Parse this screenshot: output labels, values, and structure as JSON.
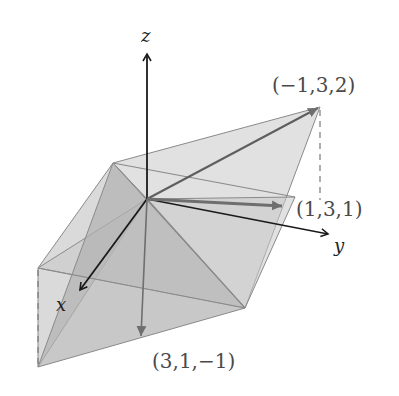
{
  "diagram": {
    "axes": {
      "x_label": "x",
      "y_label": "y",
      "z_label": "z"
    },
    "vectors": [
      {
        "label": "(−1,3,2)",
        "components": [
          -1,
          3,
          2
        ]
      },
      {
        "label": "(1,3,1)",
        "components": [
          1,
          3,
          1
        ]
      },
      {
        "label": "(3,1,−1)",
        "components": [
          3,
          1,
          -1
        ]
      }
    ],
    "colors": {
      "axis": "#1a1a1a",
      "vector": "#6e6e6e",
      "plane_light": "#d9d9d9",
      "plane_dark": "#b3b3b3",
      "edge": "#808080"
    }
  }
}
